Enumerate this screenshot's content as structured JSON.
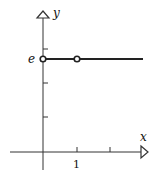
{
  "diagram": {
    "type": "function-graph",
    "axes": {
      "x_label": "x",
      "y_label": "y",
      "x_tick_labels": [
        "1"
      ],
      "y_tick_labels": [
        "e"
      ]
    },
    "graph": {
      "description": "Horizontal line y = e for x > 0 with open circles at x = 0 and x = 1",
      "value_label": "e",
      "open_points": [
        {
          "x": 0,
          "y": "e"
        },
        {
          "x": 1,
          "y": "e"
        }
      ]
    },
    "colors": {
      "stroke": "#222222",
      "background": "#ffffff"
    }
  }
}
